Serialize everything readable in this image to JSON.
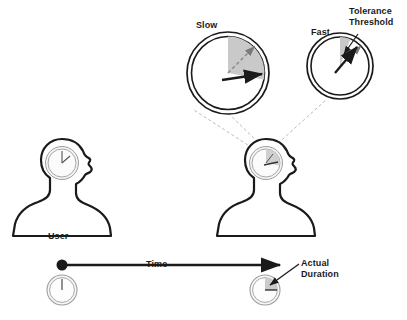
{
  "figure": {
    "labels": {
      "slow": "Slow",
      "fast": "Fast",
      "tolerance_threshold": "Tolerance\nThreshold",
      "tolerance_line1": "Tolerance",
      "tolerance_line2": "Threshold",
      "user": "User",
      "time": "Time",
      "actual_duration_line1": "Actual",
      "actual_duration_line2": "Duration"
    },
    "colors": {
      "stroke": "#1a1a1a",
      "background": "#ffffff",
      "wedge_fill": "#c9c9c9",
      "clock_face": "#f2f2f2",
      "clock_rim": "#8c8c8c",
      "dashed_guide": "#9a9a9a",
      "dashed_hand": "#7a7a7a"
    },
    "magnified_clocks": [
      {
        "name": "slow",
        "title": "Slow",
        "center": [
          228,
          73
        ],
        "radius": 41,
        "wedge_start_deg": 0,
        "wedge_end_deg": 100,
        "solid_hand_deg": 88,
        "dashed_hand_deg": 42,
        "note": "solid black hand points to about 3 o'clock; dashed estimate hand points to about 1:30"
      },
      {
        "name": "fast",
        "title": "Fast",
        "center": [
          340,
          66
        ],
        "radius": 33,
        "wedge_start_deg": 0,
        "wedge_end_deg": 22,
        "solid_hand_deg": 28,
        "dashed_hand_deg": 44,
        "note": "solid black hand points to about 1 o'clock, just outside the narrow tolerance wedge"
      }
    ],
    "people": [
      {
        "name": "user-left",
        "label": "User",
        "head_clock": {
          "center": [
            62,
            163
          ],
          "radius": 16,
          "hands_deg": [
            0,
            55
          ],
          "wedge": false
        }
      },
      {
        "name": "user-right",
        "label": "",
        "head_clock": {
          "center": [
            266,
            163
          ],
          "radius": 16,
          "hands_deg": [
            0,
            95
          ],
          "wedge": true,
          "wedge_start_deg": 0,
          "wedge_end_deg": 100
        }
      }
    ],
    "timeline": {
      "label": "Time",
      "start_point": [
        62,
        265
      ],
      "end_point": [
        283,
        265
      ],
      "start_marker": "filled-dot",
      "end_marker": "arrowhead",
      "start_clock": {
        "center": [
          62,
          290
        ],
        "radius": 15,
        "hands_deg": [
          0
        ],
        "wedge": false
      },
      "end_clock": {
        "center": [
          265,
          290
        ],
        "radius": 15,
        "hands_deg": [
          90
        ],
        "wedge": true,
        "wedge_start_deg": 0,
        "wedge_end_deg": 90,
        "callout": "Actual Duration"
      }
    },
    "zoom_guides": [
      {
        "from": [
          258,
          152
        ],
        "to": [
          196,
          112
        ]
      },
      {
        "from": [
          274,
          148
        ],
        "to": [
          330,
          100
        ]
      }
    ],
    "callout_arrows": [
      {
        "name": "tolerance-threshold-arrow",
        "from": [
          355,
          36
        ],
        "to": [
          342,
          56
        ]
      },
      {
        "name": "actual-duration-arrow",
        "from": [
          299,
          265
        ],
        "to": [
          268,
          285
        ]
      }
    ]
  }
}
